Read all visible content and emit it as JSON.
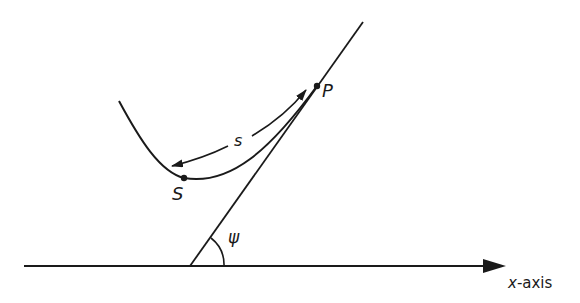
{
  "diagram": {
    "type": "geometry-figure",
    "colors": {
      "ink": "#1a1a1a",
      "background": "#ffffff"
    },
    "labels": {
      "point_P": "P",
      "point_S": "S",
      "arc_length": "s",
      "angle": "ψ",
      "axis_x_var": "x",
      "axis_suffix": "-axis"
    },
    "elements": [
      {
        "id": "x-axis",
        "kind": "arrow-line",
        "label": "x-axis"
      },
      {
        "id": "tangent-line",
        "kind": "line",
        "through": "P"
      },
      {
        "id": "curve",
        "kind": "curve",
        "passes_through": [
          "S",
          "P"
        ]
      },
      {
        "id": "arc-length-arrow",
        "kind": "double-arrow-curve",
        "label": "s",
        "from": "S",
        "to": "P"
      },
      {
        "id": "angle-arc",
        "kind": "arc",
        "label": "ψ",
        "between": [
          "x-axis",
          "tangent-line"
        ]
      }
    ]
  }
}
